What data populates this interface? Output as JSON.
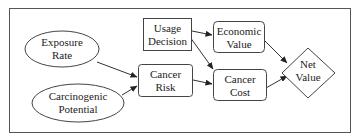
{
  "diagram": {
    "type": "influence-diagram",
    "nodes": [
      {
        "id": "exposure_rate",
        "shape": "ellipse",
        "line1": "Exposure",
        "line2": "Rate"
      },
      {
        "id": "carcinogenic_potential",
        "shape": "ellipse",
        "line1": "Carcinogenic",
        "line2": "Potential"
      },
      {
        "id": "usage_decision",
        "shape": "rectangle",
        "line1": "Usage",
        "line2": "Decision"
      },
      {
        "id": "cancer_risk",
        "shape": "rounded-rectangle",
        "line1": "Cancer",
        "line2": "Risk"
      },
      {
        "id": "economic_value",
        "shape": "rounded-rectangle",
        "line1": "Economic",
        "line2": "Value"
      },
      {
        "id": "cancer_cost",
        "shape": "rounded-rectangle",
        "line1": "Cancer",
        "line2": "Cost"
      },
      {
        "id": "net_value",
        "shape": "diamond",
        "line1": "Net",
        "line2": "Value"
      }
    ],
    "edges": [
      {
        "from": "exposure_rate",
        "to": "cancer_risk"
      },
      {
        "from": "carcinogenic_potential",
        "to": "cancer_risk"
      },
      {
        "from": "usage_decision",
        "to": "economic_value"
      },
      {
        "from": "usage_decision",
        "to": "cancer_cost"
      },
      {
        "from": "cancer_risk",
        "to": "cancer_cost"
      },
      {
        "from": "economic_value",
        "to": "net_value"
      },
      {
        "from": "cancer_cost",
        "to": "net_value"
      }
    ]
  }
}
